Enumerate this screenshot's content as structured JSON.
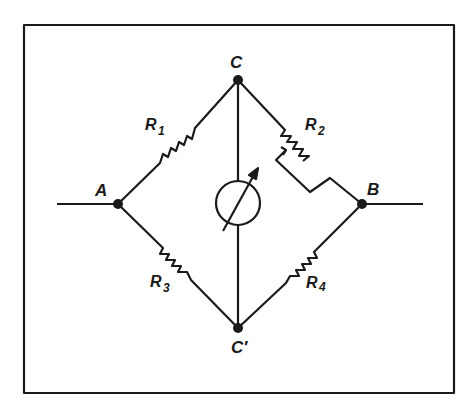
{
  "diagram": {
    "nodes": {
      "A": "A",
      "B": "B",
      "C": "C",
      "C_prime": "C′"
    },
    "resistors": {
      "r1": {
        "name": "R",
        "sub": "1"
      },
      "r2": {
        "name": "R",
        "sub": "2"
      },
      "r3": {
        "name": "R",
        "sub": "3"
      },
      "r4": {
        "name": "R",
        "sub": "4"
      }
    },
    "galvanometer": "galvanometer-icon",
    "colors": {
      "ink": "#1a1a1a",
      "background": "#ffffff"
    }
  }
}
